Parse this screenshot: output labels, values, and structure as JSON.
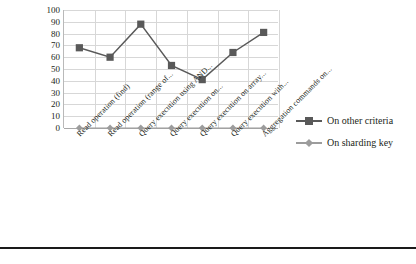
{
  "chart_data": {
    "type": "line",
    "title": "",
    "xlabel": "",
    "ylabel": "",
    "ylim": [
      0,
      100
    ],
    "yticks": [
      0,
      10,
      20,
      30,
      40,
      50,
      60,
      70,
      80,
      90,
      100
    ],
    "grid": true,
    "legend_position": "right",
    "categories": [
      "Read operation (find)",
      "Read operation (range of...",
      "Query execution using AND...",
      "Query execution on...",
      "Query execution on array...",
      "Query execution with...",
      "Aggregation commands on..."
    ],
    "series": [
      {
        "name": "On other criteria",
        "color": "#595959",
        "marker": "square",
        "values": [
          68,
          60,
          88,
          53,
          41,
          64,
          81
        ]
      },
      {
        "name": "On sharding key",
        "color": "#9c9c9c",
        "marker": "diamond",
        "values": [
          0,
          0,
          0,
          0,
          0,
          0,
          0
        ]
      }
    ]
  },
  "legend": {
    "items": [
      {
        "label": "On other criteria",
        "color": "#595959",
        "marker": "square"
      },
      {
        "label": "On sharding key",
        "color": "#9c9c9c",
        "marker": "diamond"
      }
    ]
  },
  "axis": {
    "y_tick_labels": [
      "100",
      "90",
      "80",
      "70",
      "60",
      "50",
      "40",
      "30",
      "20",
      "10",
      "0"
    ]
  },
  "footer": {
    "rule_color": "#1a1a1a",
    "ghost_text": ""
  }
}
